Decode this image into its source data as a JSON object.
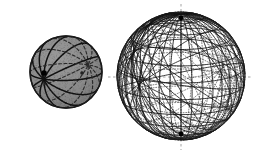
{
  "canvas": {
    "width": 259,
    "height": 152,
    "background": "#ffffff"
  },
  "colors": {
    "background": "#ffffff",
    "sphere_fill": "#8a8a8a",
    "sphere_fill_shadow": "#7c7c7c",
    "outline": "#1a1a1a",
    "line_front": "#111111",
    "line_back": "#2b2b2b",
    "node": "#000000",
    "axis": "#555555"
  },
  "figures": [
    {
      "id": "shaded-sphere",
      "label": "shaded sphere with pencil of great circles",
      "caption": "",
      "center": {
        "x": 66,
        "y": 72
      },
      "radius": 36,
      "filled": true,
      "fill": "#8a8a8a",
      "outline_width": 1.4,
      "great_circle_count": 6,
      "front_style": "solid",
      "back_style": "dashed",
      "dash_pattern": "3,2.2",
      "line_width_front": 1.5,
      "line_width_back": 1.1,
      "poles": [
        {
          "name": "front-pole",
          "x": 44,
          "y": 73,
          "visible": true,
          "radius": 2.8
        },
        {
          "name": "back-pole",
          "x": 82,
          "y": 73,
          "visible": false,
          "radius": 1.8
        }
      ],
      "pole_axis": {
        "tilt_deg": 0,
        "lon_deg": 90,
        "lat_deg": 4
      },
      "view": {
        "tilt_deg": 12,
        "yaw_deg": 0
      }
    },
    {
      "id": "dense-wireframe-sphere",
      "label": "dense wireframe sphere with many great circles",
      "caption": "",
      "center": {
        "x": 181,
        "y": 76
      },
      "radius": 64,
      "filled": false,
      "fill": "none",
      "outline_width": 0.8,
      "meridian_count": 18,
      "parallel_count": 11,
      "oblique_family_count": 3,
      "oblique_per_family": 10,
      "front_style": "solid",
      "back_style": "dotted",
      "dot_pattern": "1,1.7",
      "line_width_front": 0.85,
      "line_width_back": 0.6,
      "poles": [
        {
          "name": "north-pole",
          "x": 181,
          "y": 18,
          "visible": true,
          "radius": 2.4
        },
        {
          "name": "south-pole",
          "x": 181,
          "y": 134,
          "visible": true,
          "radius": 2.4
        }
      ],
      "axes": [
        {
          "name": "vertical-axis",
          "orientation": "vertical",
          "x1": 181,
          "y1": 4,
          "x2": 181,
          "y2": 150
        },
        {
          "name": "horizontal-axis",
          "orientation": "horizontal",
          "x1": 108,
          "y1": 77,
          "x2": 253,
          "y2": 77
        }
      ],
      "view": {
        "tilt_deg": 14,
        "yaw_deg": 0
      }
    }
  ],
  "axis_ticks": {
    "left_stub_length": 10,
    "right_stub_length": 10,
    "top_stub_length": 8,
    "bottom_stub_length": 8,
    "color": "#666666"
  },
  "annotations": []
}
